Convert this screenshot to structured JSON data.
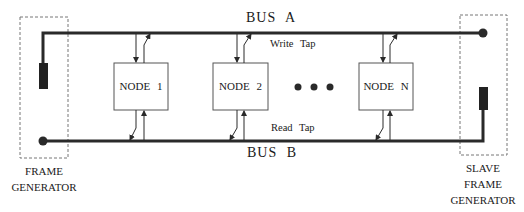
{
  "diagram": {
    "bus_a_label": "BUS  A",
    "bus_b_label": "BUS  B",
    "write_tap_label": "Write  Tap",
    "read_tap_label": "Read  Tap",
    "nodes": [
      {
        "label": "NODE  1"
      },
      {
        "label": "NODE  2"
      },
      {
        "label": "NODE  N"
      }
    ],
    "ellipsis": "• • •",
    "frame_generator": {
      "line1": "FRAME",
      "line2": "GENERATOR"
    },
    "slave_frame_generator": {
      "line1": "SLAVE",
      "line2": "FRAME",
      "line3": "GENERATOR"
    },
    "colors": {
      "line": "#2a2a2a",
      "dashed": "#777777",
      "text": "#1a1a1a"
    }
  }
}
